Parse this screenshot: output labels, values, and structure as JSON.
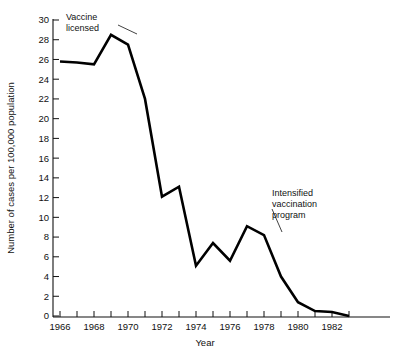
{
  "chart_data": {
    "type": "line",
    "title": "",
    "xlabel": "Year",
    "ylabel": "Number of cases per 100,000 population",
    "xlim": [
      1966,
      1983
    ],
    "ylim": [
      0,
      30
    ],
    "ytick_step": 2,
    "xtick_step": 1,
    "grid": false,
    "legend": "none",
    "x": [
      1966,
      1967,
      1968,
      1969,
      1970,
      1971,
      1972,
      1973,
      1974,
      1975,
      1976,
      1977,
      1978,
      1979,
      1980,
      1981,
      1982,
      1983
    ],
    "values": [
      25.8,
      25.7,
      25.5,
      28.5,
      27.5,
      22.0,
      12.1,
      13.1,
      5.1,
      7.4,
      5.6,
      9.1,
      8.2,
      4.0,
      1.4,
      0.5,
      0.4,
      0.0
    ],
    "series": [
      {
        "name": "Cases per 100,000 population",
        "values": [
          25.8,
          25.7,
          25.5,
          28.5,
          27.5,
          22.0,
          12.1,
          13.1,
          5.1,
          7.4,
          5.6,
          9.1,
          8.2,
          4.0,
          1.4,
          0.5,
          0.4,
          0.0
        ]
      }
    ],
    "ytick_labels": [
      "0",
      "2",
      "4",
      "6",
      "8",
      "10",
      "12",
      "14",
      "16",
      "18",
      "20",
      "22",
      "24",
      "26",
      "28",
      "30"
    ],
    "ytick_values": [
      0,
      2,
      4,
      6,
      8,
      10,
      12,
      14,
      16,
      18,
      20,
      22,
      24,
      26,
      28,
      30
    ],
    "xtick_values": [
      1966,
      1967,
      1968,
      1969,
      1970,
      1971,
      1972,
      1973,
      1974,
      1975,
      1976,
      1977,
      1978,
      1979,
      1980,
      1981,
      1982,
      1983
    ],
    "xtick_labels_shown": [
      "1966",
      "1968",
      "1970",
      "1972",
      "1974",
      "1976",
      "1978",
      "1980",
      "1982"
    ],
    "xtick_labeled_values": [
      1966,
      1968,
      1970,
      1972,
      1974,
      1976,
      1978,
      1980,
      1982
    ],
    "annotations": [
      {
        "text": "Vaccine licensed",
        "lines": [
          "Vaccine",
          "licensed"
        ],
        "points_to_year": 1969,
        "points_to_value": 28.5
      },
      {
        "text": "Intensified vaccination program",
        "lines": [
          "Intensified",
          "vaccination",
          "program"
        ],
        "points_to_year": 1978,
        "points_to_value": 8.2
      }
    ],
    "line_color": "#000000",
    "background_color": "#ffffff",
    "axis_color": "#111111"
  }
}
